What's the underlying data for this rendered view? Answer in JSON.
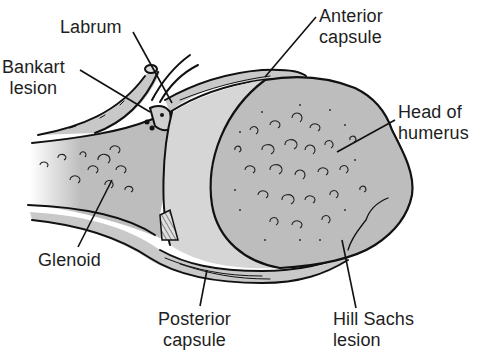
{
  "diagram": {
    "colors": {
      "background": "#ffffff",
      "bone_fill": "#bdbdbd",
      "capsule_fill": "#c9c9c9",
      "cartilage_fill": "#d6d6d6",
      "line": "#111111",
      "text": "#1e1e1e"
    },
    "labels": {
      "labrum": {
        "lines": [
          "Labrum"
        ]
      },
      "bankart_lesion": {
        "lines": [
          "Bankart",
          "lesion"
        ]
      },
      "anterior_capsule": {
        "lines": [
          "Anterior",
          "capsule"
        ]
      },
      "head_of_humerus": {
        "lines": [
          "Head of",
          "humerus"
        ]
      },
      "glenoid": {
        "lines": [
          "Glenoid"
        ]
      },
      "posterior_capsule": {
        "lines": [
          "Posterior",
          "capsule"
        ]
      },
      "hill_sachs_lesion": {
        "lines": [
          "Hill Sachs",
          "lesion"
        ]
      }
    }
  }
}
